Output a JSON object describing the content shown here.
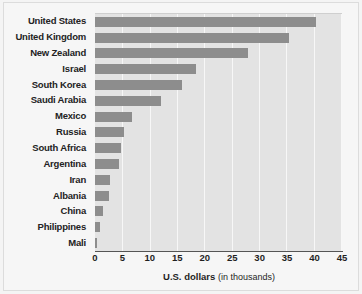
{
  "chart_data": {
    "type": "bar",
    "orientation": "horizontal",
    "title": "",
    "subtitle": "",
    "xlabel": "U.S. dollars",
    "xlabel_suffix": "(in thousands)",
    "ylabel": "",
    "xlim": [
      0,
      45
    ],
    "xticks": [
      0,
      5,
      10,
      15,
      20,
      25,
      30,
      35,
      40,
      45
    ],
    "xtick_labels": [
      "0",
      "5",
      "10",
      "15",
      "20",
      "25",
      "30",
      "35",
      "40",
      "45"
    ],
    "grid": true,
    "grid_axis": "x",
    "legend": false,
    "legend_position": "none",
    "categories": [
      "United States",
      "United Kingdom",
      "New Zealand",
      "Israel",
      "South Korea",
      "Saudi Arabia",
      "Mexico",
      "Russia",
      "South Africa",
      "Argentina",
      "Iran",
      "Albania",
      "China",
      "Philippines",
      "Mali"
    ],
    "values": [
      40.5,
      35.5,
      28.0,
      18.5,
      16.0,
      12.0,
      6.7,
      5.3,
      4.7,
      4.4,
      2.8,
      2.6,
      1.4,
      0.9,
      0.3
    ]
  },
  "colors": {
    "bar": "#8d8d8d",
    "plot_background": "#e3e3e3",
    "gridline": "#f7f7f7",
    "figure_background": "#f6f6f6",
    "axis_line": "#555555",
    "text": "#1f1f1f"
  }
}
